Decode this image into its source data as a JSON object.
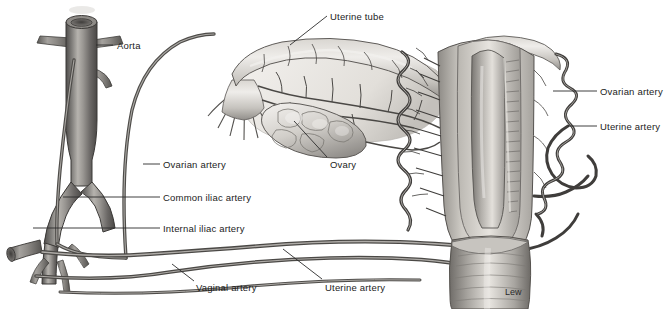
{
  "figure": {
    "background_color": "#ffffff",
    "width": 670,
    "height": 309,
    "style": "grayscale medical illustration",
    "signature": "Lew"
  },
  "palette": {
    "background": "#ffffff",
    "label_text": "#1c1c1c",
    "leader_line": "#2b2b2b",
    "vessel_dark": "#4a4a4a",
    "vessel_mid": "#7d7d7d",
    "vessel_light": "#c9c9c9",
    "tissue_light": "#e8e6e2",
    "tissue_mid": "#b9b6b1",
    "tissue_dark": "#6f6c68",
    "outline": "#3a3a3a"
  },
  "labels": [
    {
      "id": "aorta",
      "text": "Aorta",
      "text_x": 117,
      "text_y": 41,
      "leader": {
        "x1": 96,
        "y1": 45,
        "x2": 113,
        "y2": 45
      }
    },
    {
      "id": "uterine-tube",
      "text": "Uterine tube",
      "text_x": 330,
      "text_y": 12,
      "leader": {
        "x1": 290,
        "y1": 45,
        "x2": 327,
        "y2": 16
      }
    },
    {
      "id": "ovary",
      "text": "Ovary",
      "text_x": 330,
      "text_y": 160,
      "leader": {
        "x1": 294,
        "y1": 121,
        "x2": 327,
        "y2": 157
      }
    },
    {
      "id": "ovarian-artery-left",
      "text": "Ovarian artery",
      "text_x": 163,
      "text_y": 160,
      "leader": {
        "x1": 143,
        "y1": 164,
        "x2": 160,
        "y2": 164
      }
    },
    {
      "id": "common-iliac-artery",
      "text": "Common iliac artery",
      "text_x": 163,
      "text_y": 193,
      "leader": {
        "x1": 63,
        "y1": 197,
        "x2": 160,
        "y2": 197
      }
    },
    {
      "id": "internal-iliac-artery",
      "text": "Internal iliac artery",
      "text_x": 163,
      "text_y": 224,
      "leader": {
        "x1": 33,
        "y1": 228,
        "x2": 160,
        "y2": 228
      }
    },
    {
      "id": "vaginal-artery",
      "text": "Vaginal artery",
      "text_x": 196,
      "text_y": 283,
      "leader": {
        "x1": 172,
        "y1": 264,
        "x2": 194,
        "y2": 281
      }
    },
    {
      "id": "uterine-artery-lower",
      "text": "Uterine artery",
      "text_x": 325,
      "text_y": 283,
      "leader": {
        "x1": 283,
        "y1": 249,
        "x2": 322,
        "y2": 279
      }
    },
    {
      "id": "ovarian-artery-right",
      "text": "Ovarian artery",
      "text_x": 600,
      "text_y": 87,
      "leader": {
        "x1": 553,
        "y1": 91,
        "x2": 597,
        "y2": 91
      }
    },
    {
      "id": "uterine-artery-right",
      "text": "Uterine artery",
      "text_x": 600,
      "text_y": 122,
      "leader": {
        "x1": 568,
        "y1": 126,
        "x2": 597,
        "y2": 126
      }
    }
  ],
  "structures": [
    {
      "id": "aorta",
      "name": "Aorta",
      "description": "large vertical vessel, upper left, open lumen at top, with lumbar branches"
    },
    {
      "id": "common-iliac",
      "name": "Common iliac artery",
      "description": "aortic bifurcation into left and right common iliac arteries"
    },
    {
      "id": "internal-iliac",
      "name": "Internal iliac artery",
      "description": "branch descending from common iliac, lower left"
    },
    {
      "id": "ovarian-artery",
      "name": "Ovarian artery",
      "description": "long arcing artery from aorta to ovary and uterine tube"
    },
    {
      "id": "uterine-tube",
      "name": "Uterine tube",
      "description": "fallopian tube with fimbriae at lateral end, center top"
    },
    {
      "id": "ovary",
      "name": "Ovary",
      "description": "lobulated oval organ beneath the uterine tube"
    },
    {
      "id": "mesosalpinx",
      "name": "Mesosalpinx / broad ligament",
      "description": "membranous fold carrying anastomosing vessels"
    },
    {
      "id": "uterus",
      "name": "Uterus",
      "description": "sectioned uterus showing cavity and endometrium, right of center"
    },
    {
      "id": "vagina",
      "name": "Vagina",
      "description": "tubular structure with rugae below the uterus"
    },
    {
      "id": "uterine-artery-coil",
      "name": "Uterine artery",
      "description": "tortuous coiled artery along the lateral uterine wall with arcuate branches"
    },
    {
      "id": "vaginal-artery",
      "name": "Vaginal artery",
      "description": "long artery running to the vagina along the lower border"
    }
  ],
  "signature": {
    "text": "Lew",
    "x": 505,
    "y": 287
  }
}
